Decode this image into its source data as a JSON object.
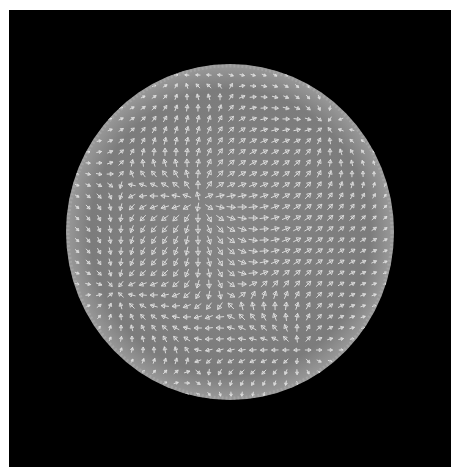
{
  "canvas": {
    "width": 451,
    "height": 475,
    "background": "#ffffff"
  },
  "viewport": {
    "x": 9,
    "y": 10,
    "width": 442,
    "height": 457,
    "background": "#000000"
  },
  "sphere": {
    "cx": 230,
    "cy": 232,
    "rx": 164,
    "ry": 168,
    "fill": "#808080",
    "rim_light": "#a8a8a8"
  },
  "glyphs": {
    "type": "arrow",
    "color": "#e6e6e6",
    "grid_spacing": 11,
    "length": 9,
    "head_size": 2.6
  },
  "field": {
    "singularities": [
      {
        "kind": "source",
        "x": 200,
        "y": 200,
        "strength": 1.0
      },
      {
        "kind": "sink",
        "x": 325,
        "y": 125,
        "strength": 1.0
      },
      {
        "kind": "sink",
        "x": 115,
        "y": 290,
        "strength": 0.8
      },
      {
        "kind": "source",
        "x": 300,
        "y": 350,
        "strength": 0.8
      },
      {
        "kind": "sink",
        "x": 180,
        "y": 75,
        "strength": 0.6
      }
    ],
    "base_flow": {
      "dx": 1.0,
      "dy": 0.15
    }
  }
}
